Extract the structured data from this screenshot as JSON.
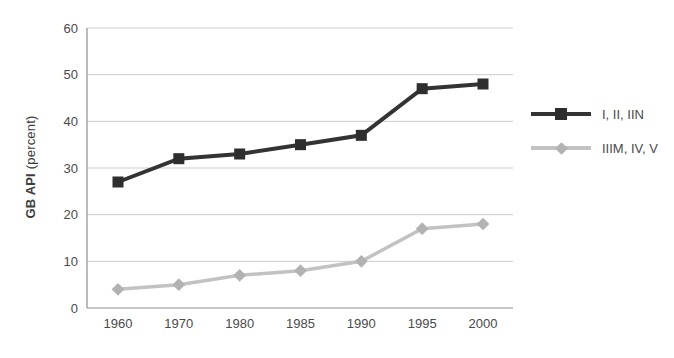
{
  "figure": {
    "y_axis_title": {
      "bold": "GB API",
      "regular": " (percent)"
    }
  },
  "axes": {
    "y_ticks": [
      "0",
      "10",
      "20",
      "30",
      "40",
      "50",
      "60"
    ],
    "x_ticks": [
      "1960",
      "1970",
      "1980",
      "1985",
      "1990",
      "1995",
      "2000"
    ]
  },
  "legend": {
    "items": [
      {
        "label": "I, II, IIN",
        "line_color": "#333333",
        "marker_color": "#2e2e2e",
        "marker": "square"
      },
      {
        "label": "IIIM, IV, V",
        "line_color": "#c2c2c2",
        "marker_color": "#b2b2b2",
        "marker": "diamond"
      }
    ]
  },
  "colors": {
    "gridline": "#cccccc",
    "axis": "#8f8f8f",
    "tick_text": "#4a4a4a"
  },
  "chart_data": {
    "type": "line",
    "categories": [
      "1960",
      "1970",
      "1980",
      "1985",
      "1990",
      "1995",
      "2000"
    ],
    "series": [
      {
        "name": "I, II, IIN",
        "values": [
          27,
          32,
          33,
          35,
          37,
          47,
          48
        ],
        "color": "#333333",
        "marker": "square",
        "marker_color": "#2e2e2e",
        "line_width": 4
      },
      {
        "name": "IIIM, IV, V",
        "values": [
          4,
          5,
          7,
          8,
          10,
          17,
          18
        ],
        "color": "#c2c2c2",
        "marker": "diamond",
        "marker_color": "#b2b2b2",
        "line_width": 3.5
      }
    ],
    "title": "",
    "xlabel": "",
    "ylabel": "GB API (percent)",
    "ylim": [
      0,
      60
    ],
    "ytick_step": 10,
    "grid": true,
    "legend_position": "right"
  }
}
